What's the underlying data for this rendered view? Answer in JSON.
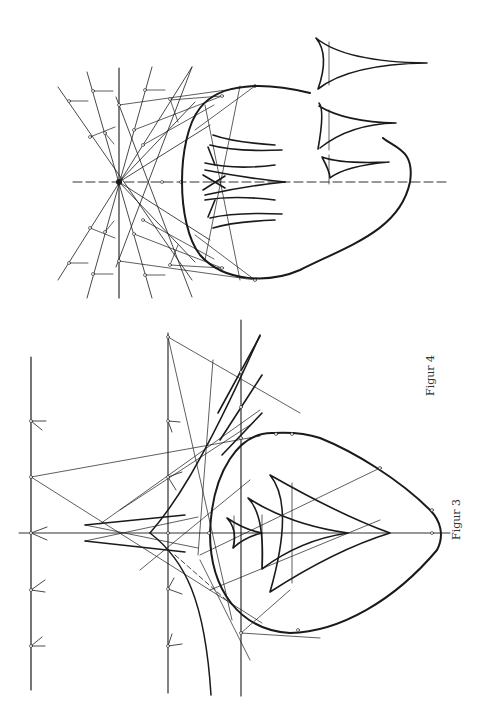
{
  "page": {
    "background": "#ffffff",
    "ink_color": "#1a1a1a",
    "orientation": "rotated-90-ccw"
  },
  "figures": [
    {
      "id": "figur-3",
      "caption": "Figur 3",
      "description": "Construction of a convex oval with tangent lines drawn from points on a family of parallel lines; nested cusped curves (evolute-like deltoids) inside the oval, and an outer envelope curve meeting at a cusp on the axis."
    },
    {
      "id": "figur-4",
      "caption": "Figur 4",
      "description": "Pencil of lines through a central point on the dashed axis, with marked points and tick segments, tangent lines to an egg-shaped oval; cusped curves clustered near the axis inside the oval and three separate cusped curves drawn beside it."
    }
  ]
}
